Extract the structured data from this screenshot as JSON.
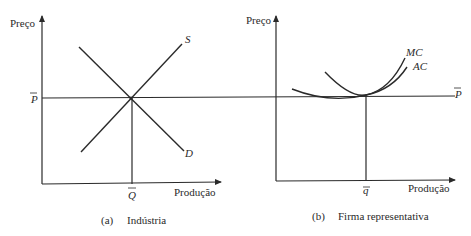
{
  "panels": [
    {
      "id": "a",
      "y_label": "Preço",
      "x_label": "Produção",
      "price_label": "P",
      "quantity_label": "Q",
      "curves": [
        {
          "name": "supply",
          "label": "S"
        },
        {
          "name": "demand",
          "label": "D"
        }
      ],
      "caption_letter": "(a)",
      "caption_text": "Indústria"
    },
    {
      "id": "b",
      "y_label": "Preço",
      "x_label": "Produção",
      "price_label": "P",
      "quantity_label": "q",
      "curves": [
        {
          "name": "marginal-cost",
          "label": "MC"
        },
        {
          "name": "average-cost",
          "label": "AC"
        }
      ],
      "caption_letter": "(b)",
      "caption_text": "Firma representativa"
    }
  ],
  "colors": {
    "line": "#2a2a2a",
    "background": "#ffffff"
  }
}
